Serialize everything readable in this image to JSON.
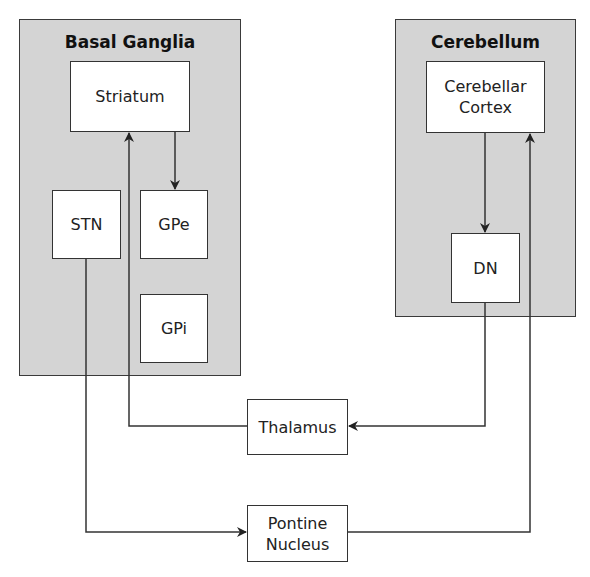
{
  "diagram": {
    "top_caption_partial": "",
    "groups": [
      {
        "id": "basal-ganglia",
        "title": "Basal Ganglia"
      },
      {
        "id": "cerebellum",
        "title": "Cerebellum"
      }
    ],
    "nodes": {
      "striatum": "Striatum",
      "stn": "STN",
      "gpe": "GPe",
      "gpi": "GPi",
      "cerebellar_cortex": "Cerebellar\nCortex",
      "dn": "DN",
      "thalamus": "Thalamus",
      "pontine_nucleus": "Pontine\nNucleus"
    },
    "connections": [
      {
        "from": "Striatum",
        "to": "GPe"
      },
      {
        "from": "Thalamus",
        "to": "Striatum"
      },
      {
        "from": "DN",
        "to": "Thalamus"
      },
      {
        "from": "STN",
        "to": "Pontine Nucleus"
      },
      {
        "from": "Pontine Nucleus",
        "to": "Cerebellar Cortex"
      },
      {
        "from": "Cerebellar Cortex",
        "to": "DN"
      }
    ],
    "colors": {
      "group_fill": "#d4d4d4",
      "stroke": "#333333",
      "node_fill": "#ffffff"
    }
  }
}
